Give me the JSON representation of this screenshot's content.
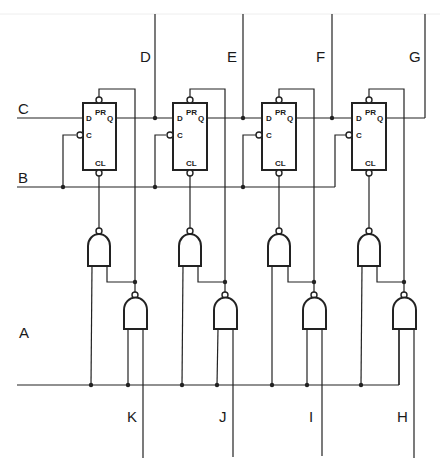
{
  "diagram": {
    "title": "",
    "colors": {
      "line": "#222222",
      "background": "#ffffff"
    },
    "signal_labels": {
      "A": "A",
      "B": "B",
      "C": "C",
      "D": "D",
      "E": "E",
      "F": "F",
      "G": "G",
      "H": "H",
      "I": "I",
      "J": "J",
      "K": "K"
    },
    "flip_flops": [
      {
        "id": "FF1",
        "pins": {
          "pr": "PR",
          "d": "D",
          "q": "Q",
          "c": "C",
          "cl": "CL"
        },
        "output_tap": "D"
      },
      {
        "id": "FF2",
        "pins": {
          "pr": "PR",
          "d": "D",
          "q": "Q",
          "c": "C",
          "cl": "CL"
        },
        "output_tap": "E"
      },
      {
        "id": "FF3",
        "pins": {
          "pr": "PR",
          "d": "D",
          "q": "Q",
          "c": "C",
          "cl": "CL"
        },
        "output_tap": "F"
      },
      {
        "id": "FF4",
        "pins": {
          "pr": "PR",
          "d": "D",
          "q": "Q",
          "c": "C",
          "cl": "CL"
        },
        "output_tap": "G"
      }
    ],
    "upper_gates": [
      {
        "type": "NAND",
        "drives": "FF1.CL"
      },
      {
        "type": "NAND",
        "drives": "FF2.CL"
      },
      {
        "type": "NAND",
        "drives": "FF3.CL"
      },
      {
        "type": "NAND",
        "drives": "FF4.CL"
      }
    ],
    "lower_gates": [
      {
        "type": "NAND",
        "drives": "FF1.PR",
        "load_input": "K"
      },
      {
        "type": "NAND",
        "drives": "FF2.PR",
        "load_input": "J"
      },
      {
        "type": "NAND",
        "drives": "FF3.PR",
        "load_input": "I"
      },
      {
        "type": "NAND",
        "drives": "FF4.PR",
        "load_input": "H"
      }
    ],
    "inputs": {
      "serial_in": "C",
      "clock": "B",
      "load_enable": "A"
    },
    "outputs": [
      "D",
      "E",
      "F",
      "G"
    ],
    "parallel_inputs": [
      "K",
      "J",
      "I",
      "H"
    ]
  }
}
